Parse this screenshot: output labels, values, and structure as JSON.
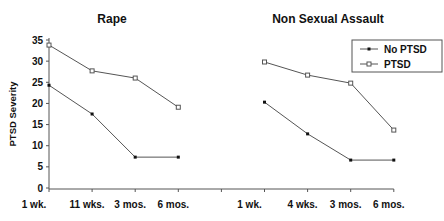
{
  "chart_data": [
    {
      "type": "line",
      "title": "Rape",
      "categories": [
        "1 wk.",
        "11 wks.",
        "3 mos.",
        "6 mos."
      ],
      "series": [
        {
          "name": "No PTSD",
          "marker": "filled-diamond",
          "values": [
            24.3,
            17.5,
            7.3,
            7.3
          ]
        },
        {
          "name": "PTSD",
          "marker": "open-square",
          "values": [
            33.8,
            27.7,
            26.0,
            19.1
          ]
        }
      ],
      "xlabel": "",
      "ylabel": "PTSD Severity",
      "ylim": [
        0,
        35
      ],
      "yticks": [
        0,
        5,
        10,
        15,
        20,
        25,
        30,
        35
      ],
      "grid": false
    },
    {
      "type": "line",
      "title": "Non Sexual Assault",
      "categories": [
        "1 wk.",
        "4 wks.",
        "3 mos.",
        "6 mos."
      ],
      "series": [
        {
          "name": "No PTSD",
          "marker": "filled-diamond",
          "values": [
            20.3,
            12.8,
            6.6,
            6.6
          ]
        },
        {
          "name": "PTSD",
          "marker": "open-square",
          "values": [
            29.8,
            26.7,
            24.8,
            13.7
          ]
        }
      ],
      "xlabel": "",
      "ylabel": "PTSD Severity",
      "ylim": [
        0,
        35
      ],
      "grid": false,
      "legend_position": "top-right"
    }
  ],
  "legend": {
    "entries": [
      {
        "label": "No PTSD",
        "marker": "filled-diamond"
      },
      {
        "label": "PTSD",
        "marker": "open-square"
      }
    ]
  },
  "colors": {
    "line": "#555555",
    "axis": "#555555",
    "text": "#111111"
  }
}
